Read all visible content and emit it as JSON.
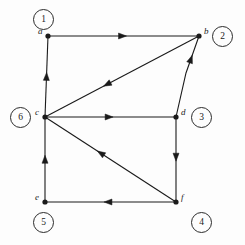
{
  "figure": {
    "type": "directed-graph-diagram",
    "background_color": "#fdfdfd",
    "stroke_color": "#1a1a1a",
    "width": 245,
    "height": 245
  },
  "nodes": [
    {
      "id": "a",
      "label": "a",
      "index_label": "1",
      "x": 48,
      "y": 36,
      "label_dx": -10,
      "label_dy": -4,
      "badge_x": 33,
      "badge_y": 9
    },
    {
      "id": "b",
      "label": "b",
      "index_label": "2",
      "x": 199,
      "y": 36,
      "label_dx": 5,
      "label_dy": -4,
      "badge_x": 212,
      "badge_y": 26
    },
    {
      "id": "c",
      "label": "c",
      "index_label": "6",
      "x": 45,
      "y": 117,
      "label_dx": -10,
      "label_dy": -4,
      "badge_x": 10,
      "badge_y": 107
    },
    {
      "id": "d",
      "label": "d",
      "index_label": "3",
      "x": 176,
      "y": 117,
      "label_dx": 5,
      "label_dy": -4,
      "badge_x": 191,
      "badge_y": 107
    },
    {
      "id": "e",
      "label": "e",
      "index_label": "5",
      "x": 45,
      "y": 202,
      "label_dx": -10,
      "label_dy": -4,
      "badge_x": 33,
      "badge_y": 212
    },
    {
      "id": "f",
      "label": "f",
      "index_label": "4",
      "x": 176,
      "y": 202,
      "label_dx": 5,
      "label_dy": -4,
      "badge_x": 191,
      "badge_y": 212
    }
  ],
  "edges": [
    {
      "from": "a",
      "to": "b",
      "shape": "straight",
      "arrow_t": 0.52,
      "name": "edge-a-to-b"
    },
    {
      "from": "c",
      "to": "a",
      "shape": "straight",
      "arrow_t": 0.55,
      "name": "edge-c-to-a"
    },
    {
      "from": "b",
      "to": "c",
      "shape": "straight",
      "arrow_t": 0.62,
      "name": "edge-b-to-c"
    },
    {
      "from": "d",
      "to": "b",
      "shape": "bent",
      "bend_x": 186,
      "bend_y": 73,
      "arrow_t": 0.48,
      "name": "edge-d-to-b"
    },
    {
      "from": "c",
      "to": "d",
      "shape": "straight",
      "arrow_t": 0.52,
      "name": "edge-c-to-d"
    },
    {
      "from": "e",
      "to": "c",
      "shape": "straight",
      "arrow_t": 0.55,
      "name": "edge-e-to-c"
    },
    {
      "from": "f",
      "to": "c",
      "shape": "straight",
      "arrow_t": 0.6,
      "name": "edge-f-to-c"
    },
    {
      "from": "d",
      "to": "f",
      "shape": "straight",
      "arrow_t": 0.52,
      "name": "edge-d-to-f"
    },
    {
      "from": "f",
      "to": "e",
      "shape": "straight",
      "arrow_t": 0.55,
      "name": "edge-f-to-e"
    }
  ]
}
